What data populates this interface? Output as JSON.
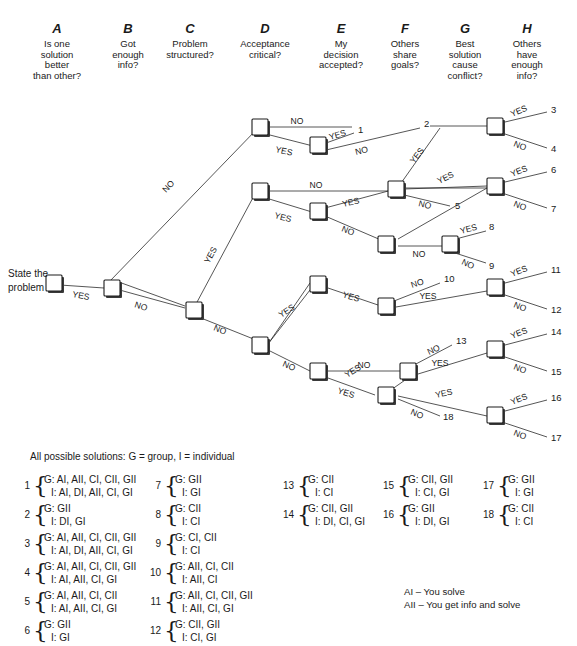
{
  "columns": [
    {
      "letter": "A",
      "question": "Is one\nsolution\nbetter\nthan other?"
    },
    {
      "letter": "B",
      "question": "Got\nenough\ninfo?"
    },
    {
      "letter": "C",
      "question": "Problem\nstructured?"
    },
    {
      "letter": "D",
      "question": "Acceptance\ncritical?"
    },
    {
      "letter": "E",
      "question": "My\ndecision\naccepted?"
    },
    {
      "letter": "F",
      "question": "Others\nshare\ngoals?"
    },
    {
      "letter": "G",
      "question": "Best\nsolution\ncause\nconflict?"
    },
    {
      "letter": "H",
      "question": "Others\nhave\nenough\ninfo?"
    }
  ],
  "tree": {
    "root_label_line1": "State the",
    "root_label_line2": "problem",
    "yes_label": "YES",
    "no_label": "NO",
    "outcome_numbers": [
      "1",
      "2",
      "3",
      "4",
      "5",
      "6",
      "7",
      "8",
      "9",
      "10",
      "11",
      "12",
      "13",
      "14",
      "15",
      "16",
      "17",
      "18"
    ]
  },
  "legend": {
    "title": "All possible solutions: G = group, I = individual",
    "solutions": [
      {
        "num": "1",
        "group": "G: AI, AII, CI, CII, GII",
        "individual": "I: AI, DI, AII, CI, GI"
      },
      {
        "num": "2",
        "group": "G: GII",
        "individual": "I: DI, GI"
      },
      {
        "num": "3",
        "group": "G: AI, AII, CI, CII, GII",
        "individual": "I: AI, DI, AII, CI, GI"
      },
      {
        "num": "4",
        "group": "G: AI, AII, CI, CII, GII",
        "individual": "I: AI, AII, CI, GI"
      },
      {
        "num": "5",
        "group": "G: AI, AII, CI, CII",
        "individual": "I: AI, AII, CI, GI"
      },
      {
        "num": "6",
        "group": "G: GII",
        "individual": "I: GI"
      },
      {
        "num": "7",
        "group": "G: GII",
        "individual": "I: GI"
      },
      {
        "num": "8",
        "group": "G: CII",
        "individual": "I: CI"
      },
      {
        "num": "9",
        "group": "G: CI, CII",
        "individual": "I: CI"
      },
      {
        "num": "10",
        "group": "G: AII, CI, CII",
        "individual": "I: AII, CI"
      },
      {
        "num": "11",
        "group": "G: AII, CI, CII, GII",
        "individual": "I: AII, CI, GI"
      },
      {
        "num": "12",
        "group": "G: CII, GII",
        "individual": "I: CI, GI"
      },
      {
        "num": "13",
        "group": "G: CII",
        "individual": "I: CI"
      },
      {
        "num": "14",
        "group": "G: CII, GII",
        "individual": "I: DI, CI, GI"
      },
      {
        "num": "15",
        "group": "G: CII, GII",
        "individual": "I: CI, GI"
      },
      {
        "num": "16",
        "group": "G: GII",
        "individual": "I: DI, GI"
      },
      {
        "num": "17",
        "group": "G: GII",
        "individual": "I: GI"
      },
      {
        "num": "18",
        "group": "G: CII",
        "individual": "I: CI"
      }
    ],
    "key": [
      "AI – You solve",
      "AII – You get info and solve"
    ]
  },
  "style": {
    "line_color": "#2b2b2b",
    "text_color": "#1a1a1a",
    "node_fill": "#ffffff"
  }
}
